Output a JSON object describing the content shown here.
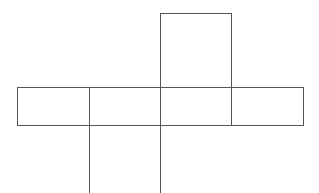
{
  "diagram": {
    "type": "cuboid-net",
    "stroke_color": "#555555",
    "background": "#ffffff",
    "faces": [
      {
        "id": "top-face",
        "x": 160,
        "y": 13,
        "w": 71,
        "h": 74
      },
      {
        "id": "row-face-1",
        "x": 17,
        "y": 87,
        "w": 72,
        "h": 38
      },
      {
        "id": "row-face-2",
        "x": 89,
        "y": 87,
        "w": 71,
        "h": 38
      },
      {
        "id": "row-face-3",
        "x": 160,
        "y": 87,
        "w": 71,
        "h": 38
      },
      {
        "id": "row-face-4",
        "x": 231,
        "y": 87,
        "w": 72,
        "h": 38
      },
      {
        "id": "bottom-face",
        "x": 89,
        "y": 125,
        "w": 71,
        "h": 68
      }
    ]
  }
}
